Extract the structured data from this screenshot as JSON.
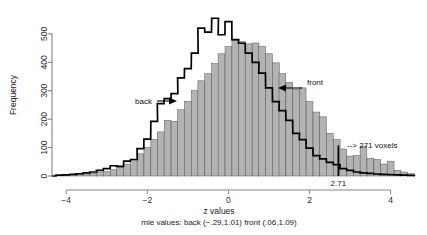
{
  "chart_data": {
    "type": "bar",
    "title": "",
    "xlabel": "z values",
    "ylabel": "Frequency",
    "subtitle": "mle values: back (−.29,1.01)  front (.06,1.09)",
    "xlim": [
      -4.35,
      4.6
    ],
    "ylim": [
      0,
      570
    ],
    "xticks": [
      -4,
      -2,
      0,
      2,
      4
    ],
    "xticklabels": [
      "−4",
      "−2",
      "0",
      "2",
      "4"
    ],
    "yticks": [
      0,
      100,
      200,
      300,
      400,
      500
    ],
    "yticklabels": [
      "0",
      "100",
      "200",
      "300",
      "400",
      "500"
    ],
    "grid": false,
    "legend_position": "none",
    "binwidth": 0.1667,
    "bin_centers": [
      -4.17,
      -4.0,
      -3.83,
      -3.67,
      -3.5,
      -3.33,
      -3.17,
      -3.0,
      -2.83,
      -2.67,
      -2.5,
      -2.33,
      -2.17,
      -2.0,
      -1.83,
      -1.67,
      -1.5,
      -1.33,
      -1.17,
      -1.0,
      -0.83,
      -0.67,
      -0.5,
      -0.33,
      -0.17,
      0.0,
      0.17,
      0.33,
      0.5,
      0.67,
      0.83,
      1.0,
      1.17,
      1.33,
      1.5,
      1.67,
      1.83,
      2.0,
      2.17,
      2.33,
      2.5,
      2.67,
      2.83,
      3.0,
      3.17,
      3.33,
      3.5,
      3.67,
      3.83,
      4.0,
      4.17,
      4.33,
      4.5
    ],
    "series": [
      {
        "name": "front",
        "style": "filled-bars",
        "color": "#b3b3b3",
        "edge_color": "#555555",
        "values": [
          2,
          3,
          4,
          5,
          7,
          9,
          12,
          16,
          22,
          30,
          42,
          58,
          78,
          100,
          128,
          155,
          196,
          192,
          233,
          263,
          300,
          335,
          360,
          395,
          430,
          455,
          478,
          473,
          465,
          468,
          455,
          430,
          398,
          360,
          330,
          305,
          310,
          262,
          225,
          208,
          150,
          128,
          95,
          70,
          72,
          105,
          62,
          58,
          42,
          52,
          20,
          14,
          8
        ]
      },
      {
        "name": "back",
        "style": "outline-step",
        "color": "#000000",
        "values": [
          3,
          4,
          6,
          8,
          11,
          14,
          20,
          26,
          36,
          34,
          52,
          58,
          96,
          130,
          192,
          255,
          272,
          290,
          345,
          378,
          432,
          520,
          506,
          555,
          497,
          543,
          480,
          467,
          432,
          400,
          362,
          310,
          262,
          230,
          196,
          150,
          128,
          98,
          72,
          60,
          48,
          40,
          26,
          20,
          14,
          11,
          9,
          7,
          6,
          5,
          4,
          3,
          2
        ]
      }
    ],
    "cutoff": {
      "value": 2.71,
      "label": "2.71",
      "line_color": "#000000"
    },
    "annotations": [
      {
        "name": "back-annotation",
        "text": "back",
        "arrow": "right"
      },
      {
        "name": "front-annotation",
        "text": "front",
        "arrow": "left"
      },
      {
        "name": "voxels-annotation",
        "text": "--> 271 voxels",
        "arrow": "none"
      }
    ]
  },
  "labels": {
    "y_axis_title": "Frequency",
    "x_axis_title": "z values",
    "subtitle": "mle values: back (−.29,1.01)  front (.06,1.09)",
    "back": "back",
    "front": "front",
    "voxels": "--> 271 voxels",
    "cutoff": "2.71",
    "ytick_0": "0",
    "ytick_100": "100",
    "ytick_200": "200",
    "ytick_300": "300",
    "ytick_400": "400",
    "ytick_500": "500",
    "xtick_m4": "−4",
    "xtick_m2": "−2",
    "xtick_0": "0",
    "xtick_2": "2",
    "xtick_4": "4"
  }
}
